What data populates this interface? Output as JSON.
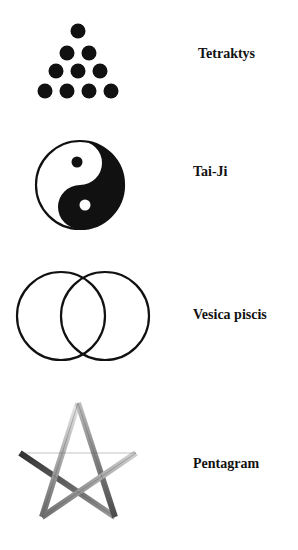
{
  "symbols": [
    {
      "id": "tetraktys",
      "label": "Tetraktys",
      "icon": "tetraktys-dot-triangle"
    },
    {
      "id": "taiji",
      "label": "Tai-Ji",
      "icon": "yin-yang"
    },
    {
      "id": "vesica",
      "label": "Vesica piscis",
      "icon": "two-overlapping-circles"
    },
    {
      "id": "pentagram",
      "label": "Pentagram",
      "icon": "five-pointed-star-outline"
    }
  ],
  "colors": {
    "ink": "#111111",
    "background": "#ffffff",
    "pentagram_dark": "#3a3a3a",
    "pentagram_light": "#d8d8d8"
  }
}
